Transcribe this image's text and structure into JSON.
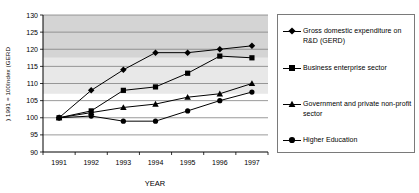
{
  "chart_data": {
    "type": "line",
    "title": "",
    "xlabel": "YEAR",
    "ylabel": "Index (GERD) 1991 = 100",
    "categories": [
      "1991",
      "1992",
      "1993",
      "1994",
      "1995",
      "1996",
      "1997"
    ],
    "x": [
      1991,
      1992,
      1993,
      1994,
      1995,
      1996,
      1997
    ],
    "ylim": [
      90,
      130
    ],
    "yticks": [
      90,
      95,
      100,
      105,
      110,
      115,
      120,
      125,
      130
    ],
    "ytick_labels": [
      "90",
      "95",
      "100",
      "105",
      "110",
      "115",
      "120",
      "125",
      "130"
    ],
    "grid": true,
    "grid_axis": "y",
    "legend_position": "right",
    "series": [
      {
        "name": "Gross domestic expenditure on R&D (GERD)",
        "marker": "diamond",
        "values": [
          100,
          108,
          114,
          119,
          119,
          120,
          121
        ]
      },
      {
        "name": "Business enterprise sector",
        "marker": "square",
        "values": [
          100,
          102,
          108,
          109,
          113,
          118,
          117.5
        ]
      },
      {
        "name": "Government and private non-profit sector",
        "marker": "triangle",
        "values": [
          100,
          101.5,
          103,
          104,
          106,
          107,
          110
        ]
      },
      {
        "name": "Higher Education",
        "marker": "circle",
        "values": [
          100,
          100.5,
          99,
          99,
          102,
          105,
          107.5
        ]
      }
    ],
    "band_color_dark": "#d4d4d4",
    "band_color_light": "#e8e8e8",
    "plot_background": "#ffffff",
    "line_color": "#000000",
    "grid_color": "#808080",
    "axis_color": "#000000"
  },
  "axes": {
    "y_title": ") 1991 = 100Index (GERD",
    "x_title": "YEAR"
  },
  "legend": {
    "items": [
      {
        "label": "Gross domestic expenditure on R&D (GERD)",
        "marker": "diamond-marker"
      },
      {
        "label": "Business enterprise sector",
        "marker": "square-marker"
      },
      {
        "label": "Government and private non-profit sector",
        "marker": "triangle-marker"
      },
      {
        "label": "Higher Education",
        "marker": "circle-marker"
      }
    ]
  }
}
